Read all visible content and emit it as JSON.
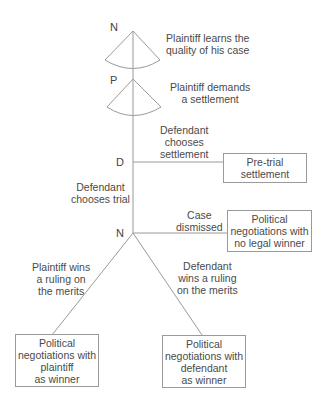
{
  "nodes": {
    "n1": "N",
    "p": "P",
    "d": "D",
    "n2": "N"
  },
  "labels": {
    "n1_move": [
      "Plaintiff learns the",
      "quality of his case"
    ],
    "p_move": [
      "Plaintiff demands",
      "a settlement"
    ],
    "d_settle": [
      "Defendant",
      "chooses",
      "settlement"
    ],
    "d_trial": [
      "Defendant",
      "chooses trial"
    ],
    "n2_dismiss": [
      "Case",
      "dismissed"
    ],
    "plaintiff_wins": [
      "Plaintiff wins",
      "a ruling on",
      "the merits"
    ],
    "defendant_wins": [
      "Defendant",
      "wins a ruling",
      "on the merits"
    ]
  },
  "outcomes": {
    "pretrial": [
      "Pre-trial",
      "settlement"
    ],
    "no_winner": [
      "Political",
      "negotiations with",
      "no legal winner"
    ],
    "plaintiff_winner": [
      "Political",
      "negotiations with",
      "plaintiff",
      "as winner"
    ],
    "defendant_winner": [
      "Political",
      "negotiations with",
      "defendant",
      "as winner"
    ]
  },
  "colors": {
    "line": "#9a9a9a",
    "text": "#4a4a4a"
  }
}
